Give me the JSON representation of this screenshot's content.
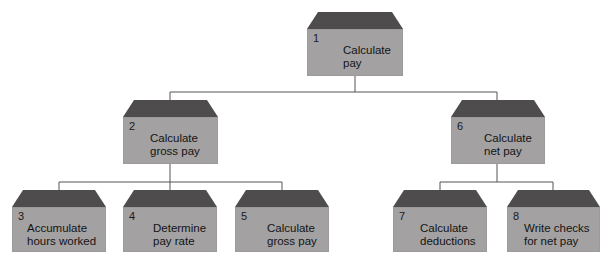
{
  "diagram": {
    "type": "hierarchy-chart",
    "colors": {
      "roof": "#4e4c4d",
      "body": "#a3a1a2",
      "line": "#555555",
      "background": "#ffffff"
    },
    "nodes": [
      {
        "id": "1",
        "number": "1",
        "line1": "Calculate",
        "line2": "pay"
      },
      {
        "id": "2",
        "number": "2",
        "line1": "Calculate",
        "line2": "gross pay"
      },
      {
        "id": "6",
        "number": "6",
        "line1": "Calculate",
        "line2": "net pay"
      },
      {
        "id": "3",
        "number": "3",
        "line1": "Accumulate",
        "line2": "hours worked"
      },
      {
        "id": "4",
        "number": "4",
        "line1": "Determine",
        "line2": "pay rate"
      },
      {
        "id": "5",
        "number": "5",
        "line1": "Calculate",
        "line2": "gross pay"
      },
      {
        "id": "7",
        "number": "7",
        "line1": "Calculate",
        "line2": "deductions"
      },
      {
        "id": "8",
        "number": "8",
        "line1": "Write checks",
        "line2": "for net pay"
      }
    ],
    "edges": [
      [
        "1",
        "2"
      ],
      [
        "1",
        "6"
      ],
      [
        "2",
        "3"
      ],
      [
        "2",
        "4"
      ],
      [
        "2",
        "5"
      ],
      [
        "6",
        "7"
      ],
      [
        "6",
        "8"
      ]
    ]
  }
}
